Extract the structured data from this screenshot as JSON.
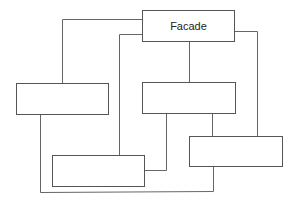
{
  "diagram": {
    "nodes": [
      {
        "id": "facade",
        "label": "Facade"
      },
      {
        "id": "subsystem-left",
        "label": ""
      },
      {
        "id": "subsystem-middle",
        "label": ""
      },
      {
        "id": "subsystem-bottom-left",
        "label": ""
      },
      {
        "id": "subsystem-bottom-right",
        "label": ""
      }
    ],
    "edges": [
      {
        "from": "facade",
        "to": "subsystem-left"
      },
      {
        "from": "facade",
        "to": "subsystem-bottom-left"
      },
      {
        "from": "facade",
        "to": "subsystem-middle"
      },
      {
        "from": "facade",
        "to": "subsystem-bottom-right"
      },
      {
        "from": "subsystem-middle",
        "to": "subsystem-bottom-left"
      },
      {
        "from": "subsystem-middle",
        "to": "subsystem-bottom-right"
      },
      {
        "from": "subsystem-left",
        "to": "subsystem-bottom-right"
      }
    ]
  }
}
